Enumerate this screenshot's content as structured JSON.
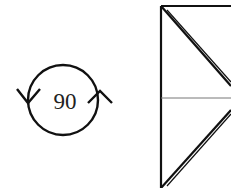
{
  "diagram": {
    "type": "origami-fold-step",
    "rotation_symbol": {
      "label": "90",
      "icon": "rotate-90-icon",
      "description": "Rotate model 90 degrees"
    },
    "paper": {
      "shape": "square-partial",
      "creases": [
        "horizontal-center-crease",
        "diagonal-top",
        "diagonal-bottom"
      ]
    },
    "colors": {
      "stroke": "#111111",
      "crease": "#777777",
      "background": "#ffffff"
    }
  }
}
